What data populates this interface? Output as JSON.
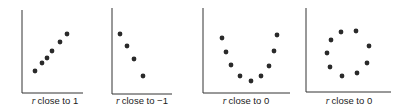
{
  "chart_data": [
    {
      "type": "scatter",
      "title": "",
      "caption": "r close to 1",
      "xlabel": "",
      "ylabel": "",
      "grid": false,
      "axes": {
        "x0": 22,
        "y_top": 10,
        "y_bottom": 93,
        "x_end": 83
      },
      "points": [
        [
          35,
          71
        ],
        [
          42,
          63
        ],
        [
          47,
          58
        ],
        [
          52,
          51
        ],
        [
          60,
          42
        ],
        [
          67,
          34
        ]
      ]
    },
    {
      "type": "scatter",
      "title": "",
      "caption": "r close to −1",
      "xlabel": "",
      "ylabel": "",
      "grid": false,
      "axes": {
        "x0": 112,
        "y_top": 8,
        "y_bottom": 94,
        "x_end": 172
      },
      "points": [
        [
          120,
          34
        ],
        [
          127,
          46
        ],
        [
          134,
          59
        ],
        [
          143,
          76
        ]
      ]
    },
    {
      "type": "scatter",
      "title": "",
      "caption": "r close to 0",
      "xlabel": "",
      "ylabel": "",
      "grid": false,
      "axes": {
        "x0": 203,
        "y_top": 8,
        "y_bottom": 93,
        "x_end": 290
      },
      "points": [
        [
          222,
          38
        ],
        [
          226,
          52
        ],
        [
          231,
          65
        ],
        [
          240,
          76
        ],
        [
          251,
          81
        ],
        [
          261,
          76
        ],
        [
          269,
          66
        ],
        [
          274,
          51
        ],
        [
          277,
          35
        ]
      ]
    },
    {
      "type": "scatter",
      "title": "",
      "caption": "r close to 0",
      "xlabel": "",
      "ylabel": "",
      "grid": false,
      "axes": {
        "x0": 306,
        "y_top": 8,
        "y_bottom": 92,
        "x_end": 391
      },
      "points": [
        [
          341,
          32
        ],
        [
          356,
          31
        ],
        [
          331,
          40
        ],
        [
          369,
          46
        ],
        [
          327,
          53
        ],
        [
          367,
          63
        ],
        [
          330,
          67
        ],
        [
          357,
          73
        ],
        [
          342,
          76
        ]
      ]
    }
  ],
  "labels": [
    {
      "var": "r",
      "text": "close to 1",
      "cx": 55
    },
    {
      "var": "r",
      "text": "close to −1",
      "cx": 142
    },
    {
      "var": "r",
      "text": "close to 0",
      "cx": 246
    },
    {
      "var": "r",
      "text": "close to 0",
      "cx": 349
    }
  ],
  "colors": {
    "axis": "#333333",
    "dot": "#2a2a2a"
  }
}
